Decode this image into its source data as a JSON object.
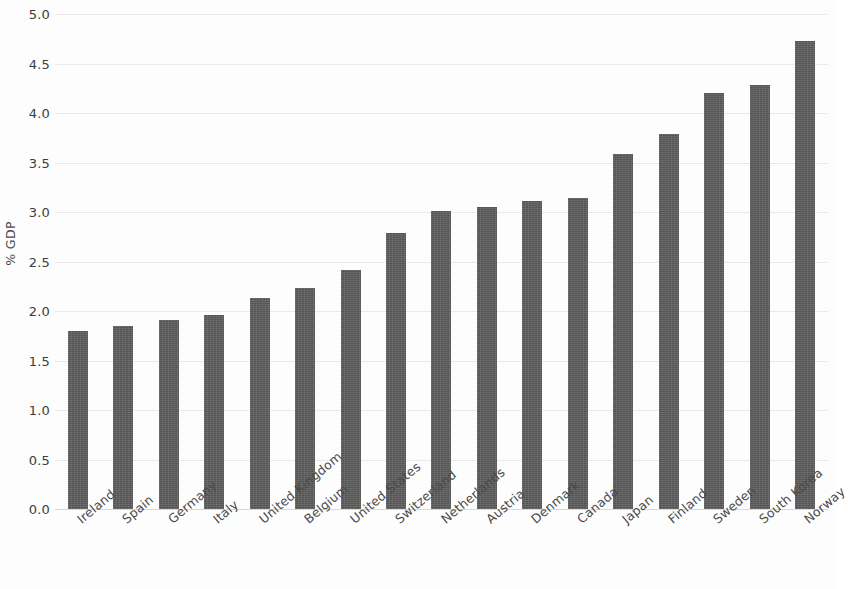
{
  "chart_data": {
    "type": "bar",
    "title": "",
    "subtitle": "",
    "xlabel": "",
    "ylabel": "% GDP",
    "ylim": [
      0.0,
      5.0
    ],
    "ytick_step": 0.5,
    "grid": true,
    "legend": false,
    "bar_color": "#5d5d5d",
    "gridline_color": "#e9e9e9",
    "categories": [
      "Ireland",
      "Spain",
      "Germany",
      "Italy",
      "United Kingdom",
      "Belgium",
      "United States",
      "Switzerland",
      "Netherlands",
      "Austria",
      "Denmark",
      "Canada",
      "Japan",
      "Finland",
      "Sweden",
      "South Korea",
      "Norway"
    ],
    "values": [
      1.8,
      1.85,
      1.91,
      1.96,
      2.13,
      2.23,
      2.41,
      2.79,
      3.01,
      3.05,
      3.11,
      3.14,
      3.59,
      3.79,
      4.2,
      4.28,
      4.73
    ],
    "ytick_labels": [
      "0.0",
      "0.5",
      "1.0",
      "1.5",
      "2.0",
      "2.5",
      "3.0",
      "3.5",
      "4.0",
      "4.5",
      "5.0"
    ],
    "ytick_values": [
      0.0,
      0.5,
      1.0,
      1.5,
      2.0,
      2.5,
      3.0,
      3.5,
      4.0,
      4.5,
      5.0
    ]
  }
}
